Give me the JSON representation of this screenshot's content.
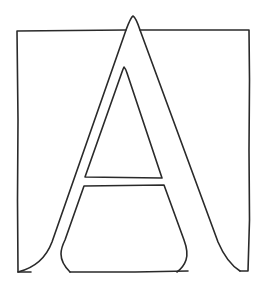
{
  "artwork": {
    "subject": "Decorated initial letter A in a square frame",
    "letter": "A",
    "background_color": "#ffffff",
    "ink_color": "#2a2a2a",
    "stroke_width": 1.6
  }
}
